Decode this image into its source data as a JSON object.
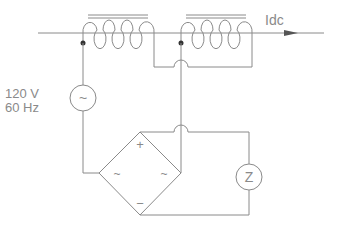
{
  "diagram": {
    "type": "circuit-schematic",
    "labels": {
      "current": "Idc",
      "source_voltage": "120 V",
      "source_frequency": "60 Hz",
      "source_symbol": "~",
      "load_symbol": "Z",
      "bridge_plus": "+",
      "bridge_minus": "−",
      "bridge_ac_left": "~",
      "bridge_ac_right": "~"
    },
    "components": [
      {
        "id": "L1",
        "kind": "inductor-iron-core",
        "turns": 4
      },
      {
        "id": "L2",
        "kind": "inductor-iron-core",
        "turns": 4
      },
      {
        "id": "V1",
        "kind": "ac-source",
        "value": "120 V",
        "frequency": "60 Hz"
      },
      {
        "id": "BR1",
        "kind": "bridge-rectifier"
      },
      {
        "id": "Z1",
        "kind": "impedance-load",
        "label": "Z"
      }
    ],
    "colors": {
      "line": "#8a8a8a",
      "background": "#ffffff"
    }
  }
}
